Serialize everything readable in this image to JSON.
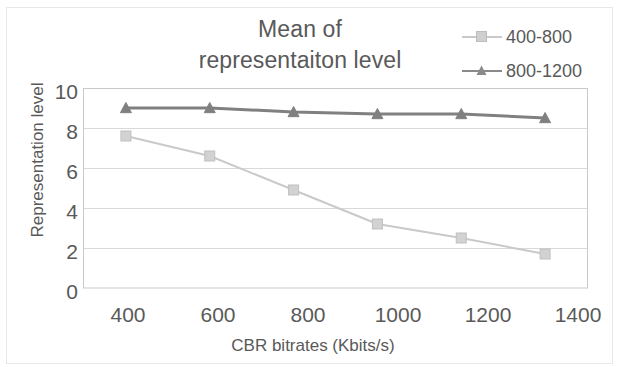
{
  "chart_data": {
    "type": "line",
    "title": "Mean of representaiton level",
    "title_line1": "Mean of",
    "title_line2": "representaiton level",
    "xlabel": "CBR bitrates (Kbits/s)",
    "ylabel": "Representation level",
    "x": [
      400,
      600,
      800,
      1000,
      1200,
      1400
    ],
    "xtick_labels": [
      "400",
      "600",
      "800",
      "1000",
      "1200",
      "1400"
    ],
    "ytick_labels": [
      "10",
      "8",
      "6",
      "4",
      "2",
      "0"
    ],
    "yticks": [
      10,
      8,
      6,
      4,
      2,
      0
    ],
    "ylim": [
      0,
      10
    ],
    "grid": "horizontal",
    "legend_position": "right",
    "series": [
      {
        "name": "400-800",
        "color": "#c9c9c9",
        "marker": "square",
        "values": [
          7.6,
          6.6,
          4.9,
          3.2,
          2.5,
          1.7
        ]
      },
      {
        "name": "800-1200",
        "color": "#808080",
        "marker": "triangle",
        "values": [
          9.0,
          9.0,
          8.8,
          8.7,
          8.7,
          8.5
        ]
      }
    ]
  },
  "legend": {
    "items": [
      {
        "label": "400-800"
      },
      {
        "label": "800-1200"
      }
    ]
  },
  "colors": {
    "series_light": "#c9c9c9",
    "series_dark": "#808080",
    "grid": "#d9d9d9",
    "axis": "#bfbfbf",
    "text": "#595959"
  }
}
